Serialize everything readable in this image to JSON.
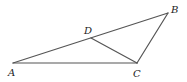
{
  "figure": {
    "title": "",
    "points": {
      "A": {
        "label": "A",
        "x": 13,
        "y": 63,
        "lx": 8,
        "ly": 76
      },
      "B": {
        "label": "B",
        "x": 168,
        "y": 13,
        "lx": 171,
        "ly": 13
      },
      "C": {
        "label": "C",
        "x": 137,
        "y": 63,
        "lx": 133,
        "ly": 77
      },
      "D": {
        "label": "D",
        "x": 91,
        "y": 38,
        "lx": 84,
        "ly": 34
      }
    },
    "segments": [
      {
        "name": "AB",
        "from": "A",
        "to": "B"
      },
      {
        "name": "AC",
        "from": "A",
        "to": "C"
      },
      {
        "name": "BC",
        "from": "B",
        "to": "C"
      },
      {
        "name": "DC",
        "from": "D",
        "to": "C"
      }
    ],
    "stroke_color": "#555555",
    "label_color": "#222222"
  }
}
